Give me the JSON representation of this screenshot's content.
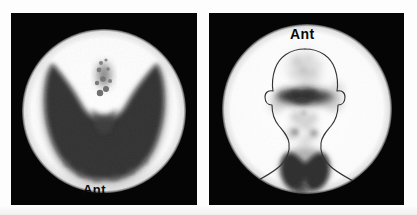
{
  "figure": {
    "modality": "nuclear-medicine-scintigram",
    "background_color": "#fdfdfd",
    "panel_background_color": "#050505",
    "field_color": "#ffffff",
    "uptake_color": "#0a0a0a",
    "outline_color": "#111111"
  },
  "panels": [
    {
      "id": "panel-left",
      "name": "pinhole-thyroid-view",
      "label": "Ant",
      "label_position": "bottom-center",
      "field": {
        "shape": "circle",
        "cx": 93,
        "cy": 98,
        "r": 82
      },
      "has_body_outline": false,
      "findings": "Enlarged thyroid with diffusely increased homogeneous uptake filling both lobes and isthmus; butterfly configuration; granular superior isthmus."
    },
    {
      "id": "panel-right",
      "name": "whole-neck-thyroid-view",
      "label": "Ant",
      "label_position": "top-center",
      "field": {
        "shape": "circle",
        "cx": 98,
        "cy": 96,
        "r": 85
      },
      "has_body_outline": true,
      "outline_parts": [
        "cranium",
        "ears",
        "jaw",
        "neck",
        "shoulders"
      ],
      "findings": "Anterior neck view with head and shoulder outline overlay; salivary gland activity across mid-face; faint mid-neck activity; intense bilobed thyroid uptake at the thyroid bed."
    }
  ],
  "labels": {
    "anterior_short": "Ant"
  }
}
